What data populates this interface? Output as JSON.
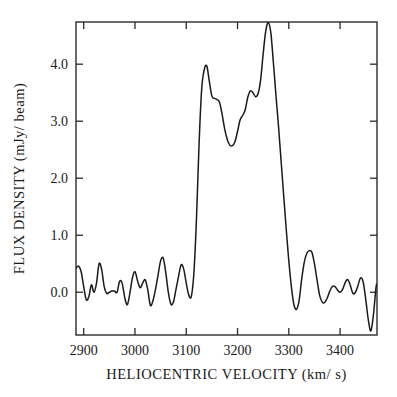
{
  "figure": {
    "background_color": "#ffffff",
    "line_color": "#1a1a1a",
    "axis_color": "#2b2b2b"
  },
  "chart_data": {
    "type": "line",
    "title": "",
    "subtitle": "",
    "xlabel": "HELIOCENTRIC  VELOCITY  (km/ s)",
    "ylabel": "FLUX DENSITY  (mJy/ beam)",
    "xlim": [
      2885,
      3472
    ],
    "ylim": [
      -0.75,
      4.74
    ],
    "xticks": [
      2900,
      3000,
      3100,
      3200,
      3300,
      3400
    ],
    "xticklabels": [
      "2900",
      "3000",
      "3100",
      "3200",
      "3300",
      "3400"
    ],
    "yticks": [
      0.0,
      1.0,
      2.0,
      3.0,
      4.0
    ],
    "yticklabels": [
      "0.0",
      "1.0",
      "2.0",
      "3.0",
      "4.0"
    ],
    "grid": false,
    "legend": null,
    "annotations": [],
    "series": [
      {
        "name": "HI spectrum",
        "color": "#1a1a1a",
        "x": [
          2885,
          2890,
          2895,
          2900,
          2905,
          2910,
          2915,
          2920,
          2925,
          2930,
          2935,
          2940,
          2945,
          2950,
          2955,
          2960,
          2965,
          2970,
          2975,
          2980,
          2985,
          2990,
          2995,
          3000,
          3005,
          3010,
          3015,
          3020,
          3025,
          3030,
          3035,
          3040,
          3045,
          3050,
          3055,
          3060,
          3065,
          3070,
          3075,
          3080,
          3085,
          3090,
          3095,
          3100,
          3105,
          3110,
          3115,
          3120,
          3125,
          3130,
          3135,
          3140,
          3145,
          3150,
          3155,
          3160,
          3165,
          3170,
          3175,
          3180,
          3185,
          3190,
          3195,
          3200,
          3205,
          3210,
          3215,
          3220,
          3225,
          3230,
          3235,
          3240,
          3245,
          3250,
          3255,
          3260,
          3265,
          3270,
          3275,
          3280,
          3285,
          3290,
          3295,
          3300,
          3305,
          3310,
          3315,
          3320,
          3325,
          3330,
          3335,
          3340,
          3345,
          3350,
          3355,
          3360,
          3365,
          3370,
          3375,
          3380,
          3385,
          3390,
          3395,
          3400,
          3405,
          3410,
          3415,
          3420,
          3425,
          3430,
          3435,
          3440,
          3445,
          3450,
          3455,
          3460,
          3465,
          3470,
          3472
        ],
        "y": [
          0.42,
          0.46,
          0.36,
          0.1,
          -0.13,
          -0.08,
          0.13,
          0.0,
          0.16,
          0.5,
          0.4,
          0.1,
          -0.02,
          0.0,
          0.02,
          0.02,
          0.0,
          0.19,
          0.16,
          -0.09,
          -0.22,
          -0.02,
          0.25,
          0.36,
          0.2,
          0.08,
          0.16,
          0.22,
          0.04,
          -0.23,
          -0.15,
          0.05,
          0.3,
          0.55,
          0.6,
          0.35,
          0.0,
          -0.21,
          -0.17,
          0.05,
          0.28,
          0.48,
          0.41,
          0.16,
          -0.05,
          -0.07,
          0.35,
          1.3,
          2.6,
          3.55,
          3.9,
          3.97,
          3.7,
          3.44,
          3.4,
          3.38,
          3.33,
          3.12,
          2.86,
          2.68,
          2.58,
          2.57,
          2.64,
          2.82,
          3.02,
          3.1,
          3.2,
          3.42,
          3.53,
          3.5,
          3.43,
          3.48,
          3.72,
          4.18,
          4.58,
          4.73,
          4.55,
          4.02,
          3.45,
          2.9,
          2.3,
          1.7,
          1.1,
          0.55,
          0.1,
          -0.22,
          -0.3,
          -0.15,
          0.22,
          0.52,
          0.68,
          0.73,
          0.7,
          0.5,
          0.22,
          -0.05,
          -0.17,
          -0.18,
          -0.1,
          0.02,
          0.1,
          0.1,
          0.04,
          0.0,
          0.05,
          0.17,
          0.22,
          0.12,
          -0.02,
          0.0,
          0.12,
          0.25,
          0.18,
          -0.12,
          -0.48,
          -0.68,
          -0.4,
          0.08,
          0.14
        ]
      }
    ]
  }
}
